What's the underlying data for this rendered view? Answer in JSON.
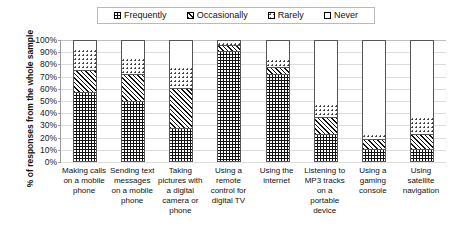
{
  "chart_data": {
    "type": "bar",
    "subtype": "stacked-bar-100-percent",
    "title": "",
    "xlabel": "",
    "ylabel": "% of responses from the whole sample",
    "ylim": [
      0,
      100
    ],
    "ytick_labels": [
      "100%",
      "90%",
      "80%",
      "70%",
      "60%",
      "50%",
      "40%",
      "30%",
      "20%",
      "10%",
      "0%"
    ],
    "ytick_values": [
      100,
      90,
      80,
      70,
      60,
      50,
      40,
      30,
      20,
      10,
      0
    ],
    "grid": true,
    "legend_position": "top-center",
    "categories": [
      "Making calls on a mobile phone",
      "Sending text messages on a mobile phone",
      "Taking pictures with a digital camera or phone",
      "Using a remote control for digital TV",
      "Using the internet",
      "Listening to MP3 tracks on a portable device",
      "Using a gaming console",
      "Using satellite navigation"
    ],
    "series": [
      {
        "name": "Frequently",
        "pattern": "dark-dotted",
        "values": [
          57,
          50,
          27,
          91,
          72,
          22,
          10,
          10
        ]
      },
      {
        "name": "Occasionally",
        "pattern": "diagonal-hatch",
        "values": [
          18,
          22,
          33,
          5,
          6,
          14,
          8,
          12
        ]
      },
      {
        "name": "Rarely",
        "pattern": "light-dotted",
        "values": [
          18,
          13,
          18,
          2,
          6,
          11,
          4,
          14
        ]
      },
      {
        "name": "Never",
        "pattern": "white",
        "values": [
          7,
          15,
          22,
          2,
          16,
          53,
          78,
          64
        ]
      }
    ]
  },
  "legend": {
    "items": [
      {
        "label": "Frequently",
        "swatch": "legend-swatch-frequently"
      },
      {
        "label": "Occasionally",
        "swatch": "legend-swatch-occasionally"
      },
      {
        "label": "Rarely",
        "swatch": "legend-swatch-rarely"
      },
      {
        "label": "Never",
        "swatch": "legend-swatch-never"
      }
    ]
  },
  "axis": {
    "y_title": "% of responses from the whole sample"
  }
}
